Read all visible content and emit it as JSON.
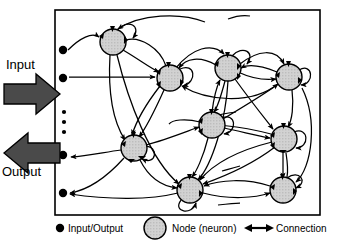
{
  "diagram": {
    "frame": {
      "x": 55,
      "y": 10,
      "w": 265,
      "h": 205,
      "stroke": "#000000",
      "stroke_width": 1.6
    },
    "colors": {
      "node_fill": "#cfcfcf",
      "node_stroke": "#000000",
      "io_dot": "#000000",
      "connection": "#000000",
      "big_arrow": "#3a3a3a",
      "background": "#ffffff"
    },
    "io_label_input": "Input",
    "io_label_output": "Output",
    "big_arrows": [
      {
        "name": "input-arrow",
        "direction": "right",
        "x": 4,
        "y": 80,
        "w": 56,
        "h": 28
      },
      {
        "name": "output-arrow",
        "direction": "left",
        "x": 4,
        "y": 140,
        "w": 56,
        "h": 28
      }
    ],
    "nodes": [
      {
        "id": "n1",
        "label": "",
        "cx": 113,
        "cy": 42,
        "r": 13,
        "self_loop": true
      },
      {
        "id": "n2",
        "label": "",
        "cx": 170,
        "cy": 78,
        "r": 13,
        "self_loop": true
      },
      {
        "id": "n3",
        "label": "",
        "cx": 228,
        "cy": 68,
        "r": 13,
        "self_loop": true
      },
      {
        "id": "n4",
        "label": "",
        "cx": 289,
        "cy": 77,
        "r": 13,
        "self_loop": true
      },
      {
        "id": "n5",
        "label": "",
        "cx": 212,
        "cy": 125,
        "r": 13,
        "self_loop": true
      },
      {
        "id": "n6",
        "label": "",
        "cx": 284,
        "cy": 139,
        "r": 13,
        "self_loop": true
      },
      {
        "id": "n7",
        "label": "",
        "cx": 134,
        "cy": 148,
        "r": 13,
        "self_loop": true
      },
      {
        "id": "n8",
        "label": "",
        "cx": 190,
        "cy": 190,
        "r": 13,
        "self_loop": true
      },
      {
        "id": "n9",
        "label": "",
        "cx": 283,
        "cy": 190,
        "r": 13,
        "self_loop": true
      }
    ],
    "io_dots": [
      {
        "id": "io1",
        "cx": 63,
        "cy": 50,
        "r": 4
      },
      {
        "id": "io2",
        "cx": 63,
        "cy": 78,
        "r": 4
      },
      {
        "id": "io3",
        "cx": 63,
        "cy": 155,
        "r": 4
      },
      {
        "id": "io4",
        "cx": 63,
        "cy": 193,
        "r": 4
      }
    ],
    "ellipsis_dots": [
      {
        "cx": 64,
        "cy": 112,
        "r": 2.1
      },
      {
        "cx": 64,
        "cy": 122,
        "r": 2.1
      },
      {
        "cx": 64,
        "cy": 132,
        "r": 2.1
      }
    ],
    "connection_count": 34
  },
  "legend": {
    "io_label": "Input/Output",
    "node_label": "Node (neuron)",
    "connection_label": "Connection",
    "io_marker": {
      "cx": 60,
      "cy": 228,
      "r": 4
    },
    "node_marker": {
      "cx": 155,
      "cy": 228,
      "r": 11
    },
    "connection_marker": {
      "x1": 245,
      "y1": 228,
      "x2": 272,
      "y2": 228
    }
  }
}
